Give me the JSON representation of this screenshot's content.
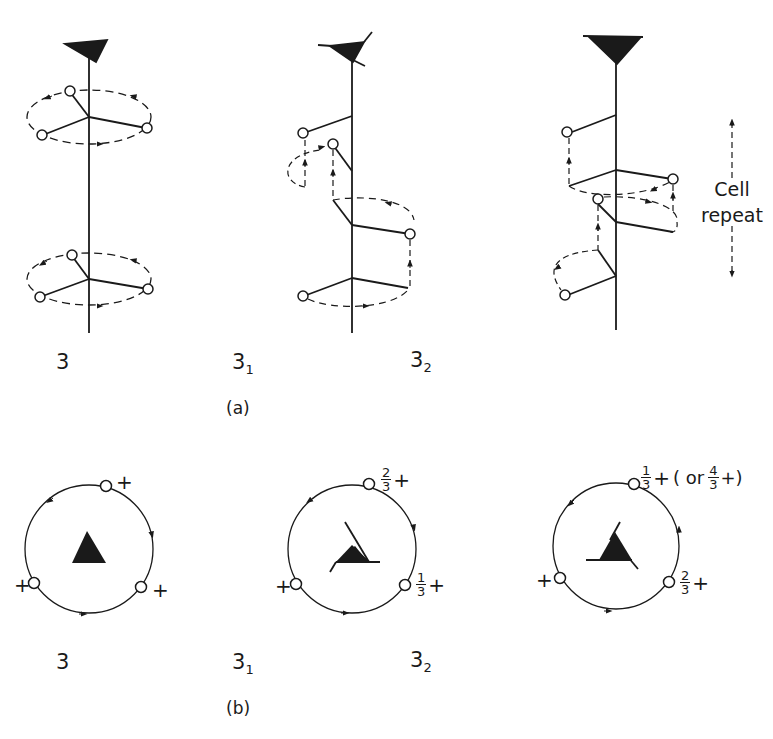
{
  "figure": {
    "part_a": {
      "caption": "(a)",
      "panels": [
        {
          "id": "3",
          "label_main": "3",
          "label_sub": "",
          "type": "proper-rotation"
        },
        {
          "id": "3_1",
          "label_main": "3",
          "label_sub": "1",
          "type": "right-handed-screw"
        },
        {
          "id": "3_2",
          "label_main": "3",
          "label_sub": "2",
          "type": "left-handed-screw"
        }
      ],
      "side_annotation": {
        "line1": "Cell",
        "line2": "repeat"
      }
    },
    "part_b": {
      "caption": "(b)",
      "panels": [
        {
          "id": "3",
          "label_main": "3",
          "label_sub": "",
          "positions": [
            {
              "where": "top",
              "height": "+"
            },
            {
              "where": "left",
              "height": "+"
            },
            {
              "where": "right",
              "height": "+"
            }
          ]
        },
        {
          "id": "3_1",
          "label_main": "3",
          "label_sub": "1",
          "positions": [
            {
              "where": "top",
              "frac_num": "2",
              "frac_den": "3",
              "sign": "+"
            },
            {
              "where": "left",
              "height": "+"
            },
            {
              "where": "right",
              "frac_num": "1",
              "frac_den": "3",
              "sign": "+"
            }
          ]
        },
        {
          "id": "3_2",
          "label_main": "3",
          "label_sub": "2",
          "positions": [
            {
              "where": "top",
              "frac_num": "1",
              "frac_den": "3",
              "sign": "+",
              "alt_prefix": "( or",
              "alt_num": "4",
              "alt_den": "3",
              "alt_suffix": "+)"
            },
            {
              "where": "left",
              "height": "+"
            },
            {
              "where": "right",
              "frac_num": "2",
              "frac_den": "3",
              "sign": "+"
            }
          ]
        }
      ]
    },
    "colors": {
      "ink": "#1a1a1a",
      "background": "#ffffff"
    },
    "symbols": {
      "axis_symbol": "filled-triangle-icon",
      "atom": "open-circle-icon"
    }
  }
}
